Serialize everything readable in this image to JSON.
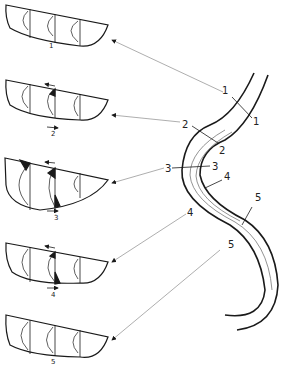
{
  "diagram": {
    "sections": [
      {
        "id": "1",
        "label": "1"
      },
      {
        "id": "2",
        "label": "2"
      },
      {
        "id": "3",
        "label": "3"
      },
      {
        "id": "4",
        "label": "4"
      },
      {
        "id": "5",
        "label": "5"
      }
    ],
    "cross_section_labels": [
      "1",
      "2",
      "3",
      "4",
      "5"
    ],
    "river_labels": {
      "s1a": "1",
      "s1b": "1",
      "s2a": "2",
      "s2b": "2",
      "s3a": "3",
      "s3b": "3",
      "s4a": "4",
      "s4b": "4",
      "s5a": "5",
      "s5b": "5"
    },
    "colors": {
      "ink": "#1a1a1a",
      "leader": "#888888",
      "background": "#ffffff"
    }
  }
}
